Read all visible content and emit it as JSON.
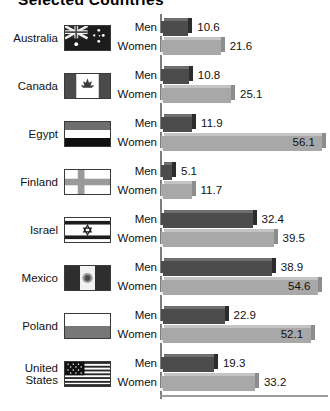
{
  "title": "Selected Countries",
  "axis": {
    "origin_x": 161,
    "max_value": 60,
    "pixels_per_unit": 2.95
  },
  "series_labels": {
    "men": "Men",
    "women": "Women"
  },
  "chart_data": {
    "type": "bar",
    "orientation": "horizontal",
    "title": "Selected Countries",
    "xlabel": "",
    "ylabel": "",
    "xlim": [
      0,
      60
    ],
    "grid": false,
    "legend": "none",
    "categories": [
      "Australia",
      "Canada",
      "Egypt",
      "Finland",
      "Israel",
      "Mexico",
      "Poland",
      "United States"
    ],
    "series": [
      {
        "name": "Men",
        "color": "#4c4c4c",
        "values": [
          10.6,
          10.8,
          11.9,
          5.1,
          32.4,
          38.9,
          22.9,
          19.3
        ]
      },
      {
        "name": "Women",
        "color": "#a8a8a8",
        "values": [
          21.6,
          25.1,
          56.1,
          11.7,
          39.5,
          54.6,
          52.1,
          33.2
        ]
      }
    ]
  },
  "rows": [
    {
      "country": "Australia",
      "country_lines": [
        "Australia"
      ],
      "flag": "flag-australia",
      "men": {
        "label": "Men",
        "value": "10.6",
        "inside": false
      },
      "women": {
        "label": "Women",
        "value": "21.6",
        "inside": false
      }
    },
    {
      "country": "Canada",
      "country_lines": [
        "Canada"
      ],
      "flag": "flag-canada",
      "men": {
        "label": "Men",
        "value": "10.8",
        "inside": false
      },
      "women": {
        "label": "Women",
        "value": "25.1",
        "inside": false
      }
    },
    {
      "country": "Egypt",
      "country_lines": [
        "Egypt"
      ],
      "flag": "flag-egypt",
      "men": {
        "label": "Men",
        "value": "11.9",
        "inside": false
      },
      "women": {
        "label": "Women",
        "value": "56.1",
        "inside": true
      }
    },
    {
      "country": "Finland",
      "country_lines": [
        "Finland"
      ],
      "flag": "flag-finland",
      "men": {
        "label": "Men",
        "value": "5.1",
        "inside": false
      },
      "women": {
        "label": "Women",
        "value": "11.7",
        "inside": false
      }
    },
    {
      "country": "Israel",
      "country_lines": [
        "Israel"
      ],
      "flag": "flag-israel",
      "men": {
        "label": "Men",
        "value": "32.4",
        "inside": false
      },
      "women": {
        "label": "Women",
        "value": "39.5",
        "inside": false
      }
    },
    {
      "country": "Mexico",
      "country_lines": [
        "Mexico"
      ],
      "flag": "flag-mexico",
      "men": {
        "label": "Men",
        "value": "38.9",
        "inside": false
      },
      "women": {
        "label": "Women",
        "value": "54.6",
        "inside": true
      }
    },
    {
      "country": "Poland",
      "country_lines": [
        "Poland"
      ],
      "flag": "flag-poland",
      "men": {
        "label": "Men",
        "value": "22.9",
        "inside": false
      },
      "women": {
        "label": "Women",
        "value": "52.1",
        "inside": true
      }
    },
    {
      "country": "United States",
      "country_lines": [
        "United",
        "States"
      ],
      "flag": "flag-united-states",
      "men": {
        "label": "Men",
        "value": "19.3",
        "inside": false
      },
      "women": {
        "label": "Women",
        "value": "33.2",
        "inside": false
      }
    }
  ]
}
